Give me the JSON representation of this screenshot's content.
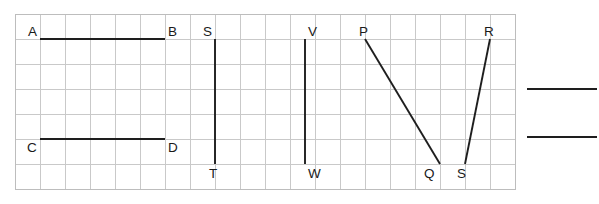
{
  "figure": {
    "type": "geometry-diagram",
    "canvas": {
      "width": 599,
      "height": 204,
      "background": "#ffffff"
    },
    "grid": {
      "origin_x": 15,
      "origin_y": 14,
      "cell_size": 25,
      "columns": 20,
      "rows": 7,
      "line_color": "#c9c9c9",
      "border_color": "#bdbdbd",
      "visible": true
    },
    "segment_color": "#1e1e1e",
    "points": [
      {
        "id": "A",
        "label": "A",
        "x": 40,
        "y": 39,
        "label_x": 28,
        "label_y": 36
      },
      {
        "id": "B",
        "label": "B",
        "x": 165,
        "y": 39,
        "label_x": 168,
        "label_y": 36
      },
      {
        "id": "C",
        "label": "C",
        "x": 40,
        "y": 139,
        "label_x": 27,
        "label_y": 152
      },
      {
        "id": "D",
        "label": "D",
        "x": 165,
        "y": 139,
        "label_x": 168,
        "label_y": 152
      },
      {
        "id": "S1",
        "label": "S",
        "x": 215,
        "y": 39,
        "label_x": 203,
        "label_y": 36
      },
      {
        "id": "T",
        "label": "T",
        "x": 215,
        "y": 164,
        "label_x": 209,
        "label_y": 178
      },
      {
        "id": "V",
        "label": "V",
        "x": 305,
        "y": 39,
        "label_x": 308,
        "label_y": 36
      },
      {
        "id": "W",
        "label": "W",
        "x": 305,
        "y": 164,
        "label_x": 308,
        "label_y": 178
      },
      {
        "id": "P",
        "label": "P",
        "x": 365,
        "y": 39,
        "label_x": 359,
        "label_y": 36
      },
      {
        "id": "Q",
        "label": "Q",
        "x": 440,
        "y": 164,
        "label_x": 424,
        "label_y": 178
      },
      {
        "id": "S2",
        "label": "S",
        "x": 465,
        "y": 164,
        "label_x": 457,
        "label_y": 178
      },
      {
        "id": "R",
        "label": "R",
        "x": 490,
        "y": 39,
        "label_x": 484,
        "label_y": 36
      }
    ],
    "segments": [
      {
        "name": "AB",
        "from": "A",
        "to": "B",
        "x1": 40,
        "y1": 39,
        "x2": 165,
        "y2": 39
      },
      {
        "name": "CD",
        "from": "C",
        "to": "D",
        "x1": 40,
        "y1": 139,
        "x2": 165,
        "y2": 139
      },
      {
        "name": "ST",
        "from": "S1",
        "to": "T",
        "x1": 215,
        "y1": 39,
        "x2": 215,
        "y2": 164
      },
      {
        "name": "VW",
        "from": "V",
        "to": "W",
        "x1": 305,
        "y1": 39,
        "x2": 305,
        "y2": 164
      },
      {
        "name": "PQ",
        "from": "P",
        "to": "Q",
        "x1": 365,
        "y1": 39,
        "x2": 440,
        "y2": 164
      },
      {
        "name": "SR",
        "from": "S2",
        "to": "R",
        "x1": 465,
        "y1": 164,
        "x2": 490,
        "y2": 39
      }
    ],
    "answer_rules": [
      {
        "name": "answer-rule-top",
        "x1": 527,
        "y1": 89,
        "x2": 597,
        "y2": 89
      },
      {
        "name": "answer-rule-bottom",
        "x1": 527,
        "y1": 137,
        "x2": 597,
        "y2": 137
      }
    ]
  }
}
